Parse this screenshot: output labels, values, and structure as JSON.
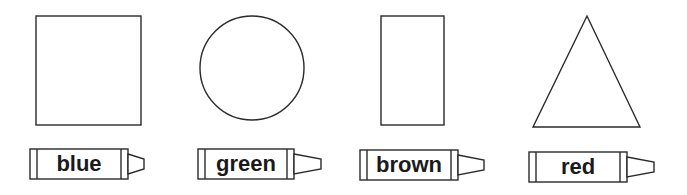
{
  "worksheet": {
    "items": [
      {
        "shape": "square",
        "shape_icon": "square-icon",
        "color_word": "blue"
      },
      {
        "shape": "circle",
        "shape_icon": "circle-icon",
        "color_word": "green"
      },
      {
        "shape": "rectangle",
        "shape_icon": "rectangle-icon",
        "color_word": "brown"
      },
      {
        "shape": "triangle",
        "shape_icon": "triangle-icon",
        "color_word": "red"
      }
    ]
  },
  "colors": {
    "outline": "#2a2a2a",
    "background": "#ffffff",
    "text": "#1a1a1a"
  }
}
